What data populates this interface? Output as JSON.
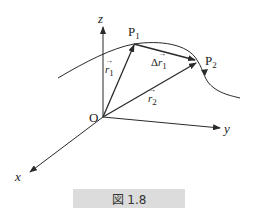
{
  "figure": {
    "caption": "図 1.8",
    "caption_background": "#dcdcdc",
    "stroke_color": "#2a2a2a"
  },
  "axes": {
    "origin_label": "O",
    "x_label": "x",
    "y_label": "y",
    "z_label": "z"
  },
  "points": {
    "p1_label": "P",
    "p1_sub": "1",
    "p2_label": "P",
    "p2_sub": "2"
  },
  "vectors": {
    "r1_label": "r",
    "r1_sub": "1",
    "r2_label": "r",
    "r2_sub": "2",
    "delta_prefix": "Δ",
    "delta_label": "r",
    "delta_sub": "1"
  }
}
